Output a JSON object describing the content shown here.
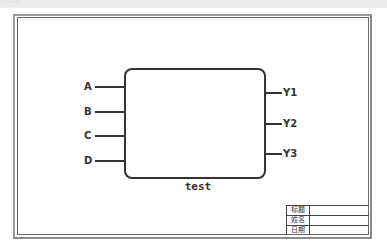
{
  "topbar": {
    "text": "········"
  },
  "diagram": {
    "block_label": "test",
    "inputs": [
      {
        "label": "A"
      },
      {
        "label": "B"
      },
      {
        "label": "C"
      },
      {
        "label": "D"
      }
    ],
    "outputs": [
      {
        "label": "Y1"
      },
      {
        "label": "Y2"
      },
      {
        "label": "Y3"
      }
    ]
  },
  "title_block": {
    "rows": [
      {
        "label": "标题",
        "value": ""
      },
      {
        "label": "姓名",
        "value": ""
      },
      {
        "label": "日期",
        "value": ""
      }
    ]
  },
  "colors": {
    "stroke": "#333333",
    "frame": "#8a8a8a",
    "background": "#ffffff"
  }
}
